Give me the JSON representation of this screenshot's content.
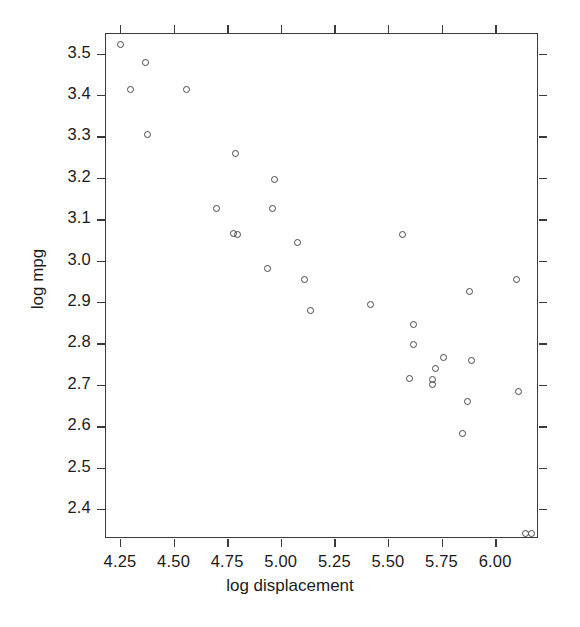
{
  "chart_data": {
    "type": "scatter",
    "title": "",
    "xlabel": "log displacement",
    "ylabel": "log mpg",
    "xlim": [
      4.18,
      6.2
    ],
    "ylim": [
      2.33,
      3.55
    ],
    "grid": false,
    "legend": "none",
    "marker": "open-circle",
    "marker_color": "#4a4a4a",
    "xticks": [
      4.25,
      4.5,
      4.75,
      5.0,
      5.25,
      5.5,
      5.75,
      6.0
    ],
    "xticklabels": [
      "4.25",
      "4.50",
      "4.75",
      "5.00",
      "5.25",
      "5.50",
      "5.75",
      "6.00"
    ],
    "yticks": [
      2.4,
      2.5,
      2.6,
      2.7,
      2.8,
      2.9,
      3.0,
      3.1,
      3.2,
      3.3,
      3.4,
      3.5
    ],
    "yticklabels": [
      "2.4",
      "2.5",
      "2.6",
      "2.7",
      "2.8",
      "2.9",
      "3.0",
      "3.1",
      "3.2",
      "3.3",
      "3.4",
      "3.5"
    ],
    "ticks_all_sides": true,
    "n_points": 35,
    "points": [
      {
        "x": 4.25,
        "y": 3.522
      },
      {
        "x": 4.37,
        "y": 3.478
      },
      {
        "x": 4.3,
        "y": 3.414
      },
      {
        "x": 4.56,
        "y": 3.414
      },
      {
        "x": 4.38,
        "y": 3.306
      },
      {
        "x": 4.79,
        "y": 3.258
      },
      {
        "x": 4.97,
        "y": 3.196
      },
      {
        "x": 4.7,
        "y": 3.126
      },
      {
        "x": 4.96,
        "y": 3.126
      },
      {
        "x": 4.78,
        "y": 3.066
      },
      {
        "x": 4.8,
        "y": 3.063
      },
      {
        "x": 5.08,
        "y": 3.045
      },
      {
        "x": 5.57,
        "y": 3.063
      },
      {
        "x": 4.94,
        "y": 2.98
      },
      {
        "x": 5.11,
        "y": 2.954
      },
      {
        "x": 6.1,
        "y": 2.954
      },
      {
        "x": 5.88,
        "y": 2.926
      },
      {
        "x": 5.42,
        "y": 2.893
      },
      {
        "x": 5.14,
        "y": 2.879
      },
      {
        "x": 5.62,
        "y": 2.847
      },
      {
        "x": 5.62,
        "y": 2.797
      },
      {
        "x": 5.76,
        "y": 2.766
      },
      {
        "x": 5.89,
        "y": 2.76
      },
      {
        "x": 5.72,
        "y": 2.74
      },
      {
        "x": 5.6,
        "y": 2.715
      },
      {
        "x": 5.71,
        "y": 2.714
      },
      {
        "x": 5.71,
        "y": 2.7
      },
      {
        "x": 5.87,
        "y": 2.66
      },
      {
        "x": 6.11,
        "y": 2.685
      },
      {
        "x": 5.85,
        "y": 2.583
      },
      {
        "x": 6.14,
        "y": 2.34
      },
      {
        "x": 6.17,
        "y": 2.34
      }
    ]
  }
}
